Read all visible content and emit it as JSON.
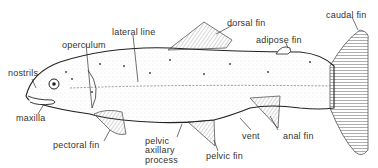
{
  "diagram": {
    "labels": {
      "nostrils": "nostrils",
      "operculum": "operculum",
      "lateral_line": "lateral line",
      "dorsal_fin": "dorsal fin",
      "adipose_fin": "adipose fin",
      "caudal_fin": "caudal fin",
      "maxilla": "maxilla",
      "pectoral_fin": "pectoral fin",
      "pelvic_axillary_process_1": "pelvic",
      "pelvic_axillary_process_2": "axillary",
      "pelvic_axillary_process_3": "process",
      "pelvic_fin": "pelvic fin",
      "vent": "vent",
      "anal_fin": "anal fin"
    }
  }
}
